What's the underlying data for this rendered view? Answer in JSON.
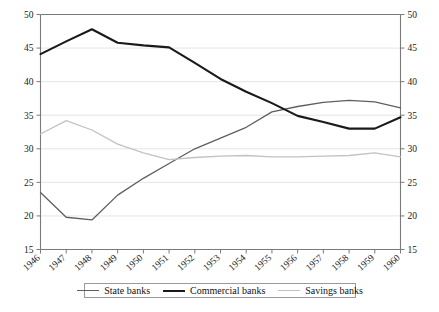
{
  "chart_data": {
    "type": "line",
    "title": "",
    "subtitle": "",
    "xlabel": "",
    "ylabel": "",
    "x": [
      1946,
      1947,
      1948,
      1949,
      1950,
      1951,
      1952,
      1953,
      1954,
      1955,
      1956,
      1957,
      1958,
      1959,
      1960
    ],
    "categories": [
      "1946",
      "1947",
      "1948",
      "1949",
      "1950",
      "1951",
      "1952",
      "1953",
      "1954",
      "1955",
      "1956",
      "1957",
      "1958",
      "1959",
      "1960"
    ],
    "series": [
      {
        "name": "State banks",
        "color": "#5f5f5f",
        "width": 1.3,
        "values": [
          23.5,
          19.8,
          19.4,
          23.1,
          25.6,
          27.8,
          30.0,
          31.6,
          33.2,
          35.5,
          36.3,
          36.9,
          37.2,
          37.0,
          36.1
        ]
      },
      {
        "name": "Commercial banks",
        "color": "#1a1a1a",
        "width": 2.1,
        "values": [
          44.1,
          46.0,
          47.8,
          45.8,
          45.4,
          45.1,
          42.8,
          40.4,
          38.5,
          36.8,
          34.9,
          34.0,
          33.0,
          33.0,
          34.7
        ]
      },
      {
        "name": "Savings banks",
        "color": "#c2c2c2",
        "width": 1.3,
        "values": [
          32.2,
          34.2,
          32.8,
          30.7,
          29.4,
          28.4,
          28.7,
          28.9,
          29.0,
          28.8,
          28.8,
          28.9,
          29.0,
          29.4,
          28.8
        ]
      }
    ],
    "ylim": [
      15,
      50
    ],
    "yticks": [
      15,
      20,
      25,
      30,
      35,
      40,
      45,
      50
    ],
    "ytick_labels_left": [
      "15",
      "20",
      "25",
      "30",
      "35",
      "40",
      "45",
      "50"
    ],
    "ytick_labels_right": [
      "15",
      "20",
      "25",
      "30",
      "35",
      "40",
      "45",
      "50"
    ],
    "grid": true,
    "grid_axis": "y",
    "legend_position": "bottom",
    "dual_y_axis": true
  },
  "legend": {
    "items": [
      {
        "label": "State banks"
      },
      {
        "label": "Commercial banks"
      },
      {
        "label": "Savings banks"
      }
    ]
  }
}
